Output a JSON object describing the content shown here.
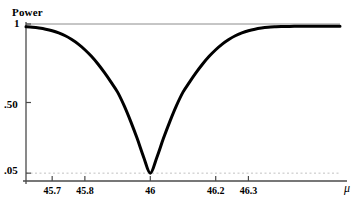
{
  "chart_data": {
    "type": "line",
    "title": "",
    "subtitle": "",
    "xlabel": "μ",
    "ylabel": "Power",
    "xlim": [
      45.62,
      46.58
    ],
    "ylim": [
      0.0,
      1.0
    ],
    "grid": false,
    "legend": null,
    "x_ticks": [
      {
        "value": 45.7,
        "label": "45.7"
      },
      {
        "value": 45.8,
        "label": "45.8"
      },
      {
        "value": 46.0,
        "label": "46"
      },
      {
        "value": 46.2,
        "label": "46.2"
      },
      {
        "value": 46.3,
        "label": "46.3"
      }
    ],
    "y_ticks": [
      {
        "value": 1.0,
        "label": "1"
      },
      {
        "value": 0.5,
        "label": ".50"
      },
      {
        "value": 0.05,
        "label": ".05"
      }
    ],
    "reference_lines": [
      {
        "name": "power-one-line",
        "y": 1.0,
        "style": "solid",
        "color": "#808080"
      },
      {
        "name": "alpha-level-line",
        "y": 0.05,
        "style": "dashed",
        "color": "#b0b0b0"
      }
    ],
    "series": [
      {
        "name": "power-curve",
        "color": "#000000",
        "linewidth": 3,
        "x": [
          45.62,
          45.64,
          45.66,
          45.68,
          45.7,
          45.72,
          45.74,
          45.76,
          45.78,
          45.8,
          45.82,
          45.84,
          45.86,
          45.88,
          45.9,
          45.92,
          45.94,
          45.96,
          45.98,
          46.0,
          46.02,
          46.04,
          46.06,
          46.08,
          46.1,
          46.12,
          46.14,
          46.16,
          46.18,
          46.2,
          46.22,
          46.24,
          46.26,
          46.28,
          46.3,
          46.32,
          46.34,
          46.36,
          46.38,
          46.4,
          46.44,
          46.48,
          46.52,
          46.58
        ],
        "y": [
          0.982,
          0.979,
          0.974,
          0.967,
          0.957,
          0.943,
          0.925,
          0.901,
          0.872,
          0.836,
          0.794,
          0.745,
          0.69,
          0.63,
          0.566,
          0.48,
          0.38,
          0.27,
          0.15,
          0.05,
          0.15,
          0.27,
          0.38,
          0.48,
          0.566,
          0.63,
          0.69,
          0.745,
          0.794,
          0.836,
          0.872,
          0.901,
          0.925,
          0.943,
          0.957,
          0.967,
          0.974,
          0.979,
          0.982,
          0.984,
          0.985,
          0.986,
          0.986,
          0.986
        ]
      }
    ],
    "annotations": []
  },
  "axis_labels": {
    "y_axis_title": "Power",
    "x_axis_symbol": "μ"
  },
  "colors": {
    "curve": "#000000",
    "axis": "#4a4a4a",
    "reference_solid": "#8a8a8a",
    "reference_dashed": "#bbbbbb",
    "background": "#ffffff"
  }
}
